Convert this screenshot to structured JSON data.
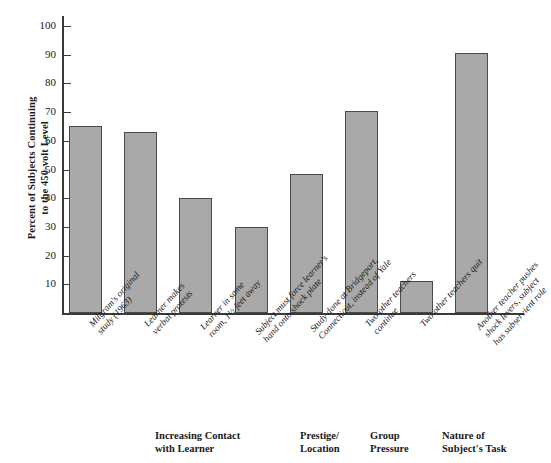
{
  "chart_data": {
    "type": "bar",
    "title": "",
    "xlabel": "",
    "ylabel": "Percent of Subjects Continuing to the 450-volt Level",
    "ylim": [
      0,
      105
    ],
    "grid": false,
    "legend": "none",
    "bar_color": "#a9a9a9",
    "bar_border_color": "#4a4a4a",
    "axis_color": "#3a3a3a",
    "categories": [
      "Milgram's original study (1963)",
      "Learner makes verbal protests",
      "Learner in same room, 1½ feet away",
      "Subject must force learner's hand onto shock plate",
      "Study done at Bridgeport, Connecticut, instead of Yale",
      "Two other teachers continue",
      "Two other teachers quit",
      "Another teacher pushes shock levers, subject has subservient role"
    ],
    "values": [
      65,
      63,
      40,
      30,
      48.5,
      70.5,
      11,
      90.5
    ],
    "ytick_labels": [
      "10",
      "20",
      "30",
      "40",
      "50",
      "60",
      "70",
      "80",
      "90",
      "100"
    ],
    "ytick_values": [
      10,
      20,
      30,
      40,
      50,
      60,
      70,
      80,
      90,
      100
    ]
  },
  "y_axis": {
    "title_line1": "Percent of Subjects Continuing",
    "title_line2": "to the 450-volt Level"
  },
  "categories_wrapped": [
    {
      "line1": "Milgram's original",
      "line2": "study (1963)"
    },
    {
      "line1": "Learner makes",
      "line2": "verbal protests"
    },
    {
      "line1": "Learner in same",
      "line2": "room, 1½ feet away"
    },
    {
      "line1": "Subject must force learner's",
      "line2": "hand onto shock plate"
    },
    {
      "line1": "Study done at Bridgeport,",
      "line2": "Connecticut, instead of Yale"
    },
    {
      "line1": "Two other teachers",
      "line2": "continue"
    },
    {
      "line1": "Two other teachers quit",
      "line2": ""
    },
    {
      "line1": "Another teacher pushes",
      "line2": "shock levers, subject",
      "line3": "has subservient role"
    }
  ],
  "group_headers": [
    {
      "line1": "Increasing Contact",
      "line2": "with Learner"
    },
    {
      "line1": "Prestige/",
      "line2": "Location"
    },
    {
      "line1": "Group",
      "line2": "Pressure"
    },
    {
      "line1": "Nature of",
      "line2": "Subject's Task"
    }
  ]
}
